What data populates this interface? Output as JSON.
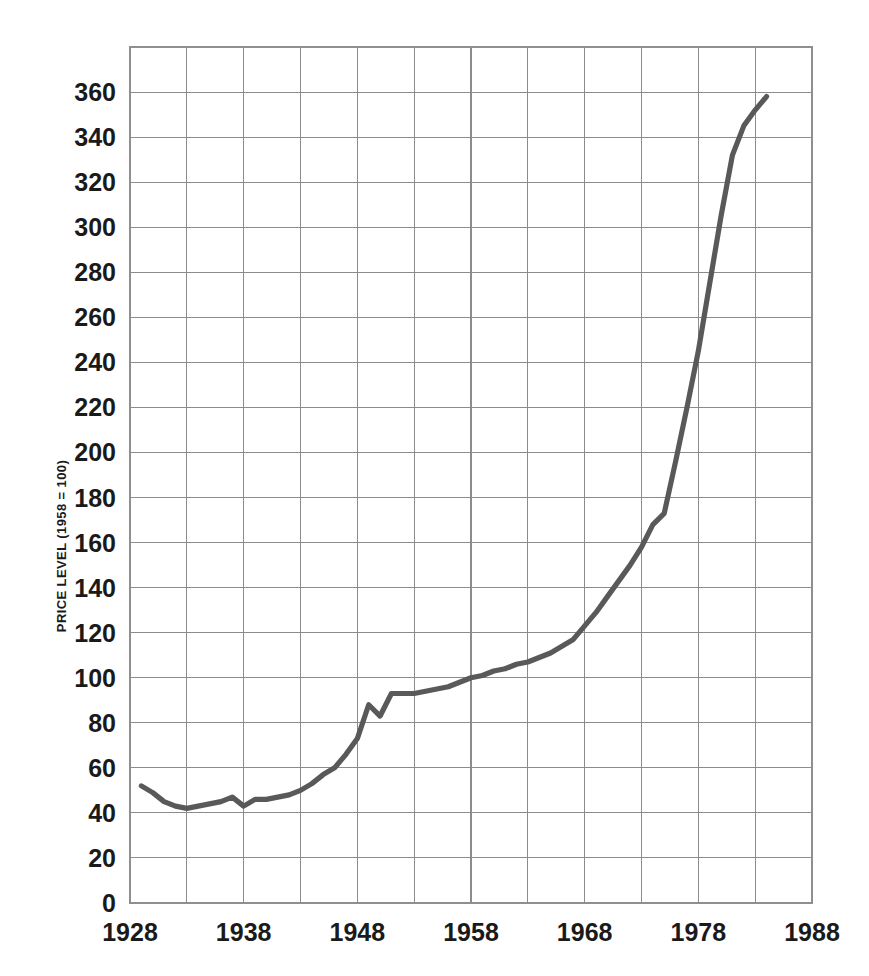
{
  "figure": {
    "background_color": "#ffffff",
    "line_color": "#595959",
    "grid_color": "#8c8c8c",
    "frame_color": "#8f8f8f",
    "text_color": "#1a1a1a"
  },
  "axes": {
    "y_axis_title": "PRICE LEVEL (1958 = 100)",
    "x_axis_title": "",
    "y_ticks": [
      "0",
      "20",
      "40",
      "60",
      "80",
      "100",
      "120",
      "140",
      "160",
      "180",
      "200",
      "220",
      "240",
      "260",
      "280",
      "300",
      "320",
      "340",
      "360"
    ],
    "x_ticks": [
      "1928",
      "1938",
      "1948",
      "1958",
      "1968",
      "1978",
      "1988"
    ],
    "x_minor_gridlines": [
      "1933",
      "1943",
      "1953",
      "1963",
      "1973",
      "1983"
    ]
  },
  "chart_data": {
    "type": "line",
    "title": "",
    "subtitle": "",
    "xlabel": "",
    "ylabel": "PRICE LEVEL (1958 = 100)",
    "xlim": [
      1928,
      1988
    ],
    "ylim": [
      0,
      380
    ],
    "y_tick_step": 20,
    "x_tick_step": 10,
    "x_gridline_step": 5,
    "grid": true,
    "legend": false,
    "legend_position": "none",
    "annotations": [],
    "series": [
      {
        "name": "Price level",
        "color": "#595959",
        "x": [
          1929,
          1930,
          1931,
          1932,
          1933,
          1934,
          1935,
          1936,
          1937,
          1938,
          1939,
          1940,
          1941,
          1942,
          1943,
          1944,
          1945,
          1946,
          1947,
          1948,
          1949,
          1950,
          1951,
          1952,
          1953,
          1954,
          1955,
          1956,
          1957,
          1958,
          1959,
          1960,
          1961,
          1962,
          1963,
          1964,
          1965,
          1966,
          1967,
          1968,
          1969,
          1970,
          1971,
          1972,
          1973,
          1974,
          1975,
          1976,
          1977,
          1978,
          1979,
          1980,
          1981,
          1982,
          1983,
          1984
        ],
        "y": [
          52,
          49,
          45,
          43,
          42,
          43,
          44,
          45,
          47,
          43,
          46,
          46,
          47,
          48,
          50,
          53,
          57,
          60,
          66,
          73,
          88,
          83,
          93,
          93,
          93,
          94,
          95,
          96,
          98,
          100,
          101,
          103,
          104,
          106,
          107,
          109,
          111,
          114,
          117,
          123,
          129,
          136,
          143,
          150,
          158,
          168,
          173,
          196,
          220,
          245,
          275,
          305,
          332,
          345,
          352,
          358
        ]
      }
    ]
  }
}
